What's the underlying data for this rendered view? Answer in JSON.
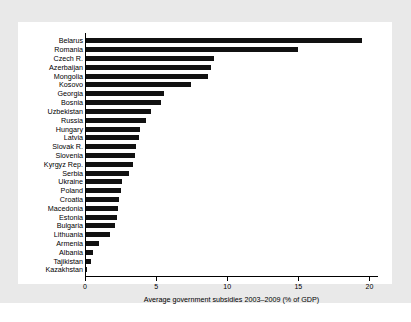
{
  "chart_data": {
    "type": "bar",
    "orientation": "horizontal",
    "title": "",
    "xlabel": "Average government subsidies 2003–2009 (% of GDP)",
    "ylabel": "",
    "xlim": [
      0,
      20.6
    ],
    "xticks": [
      0,
      5,
      10,
      15,
      20
    ],
    "xtick_labels": [
      "0",
      "5",
      "10",
      "15",
      "20"
    ],
    "grid": false,
    "legend": null,
    "bar_color": "#111111",
    "panel_background": "#ffffff",
    "figure_background": "#e9e9e9",
    "categories": [
      "Belarus",
      "Romania",
      "Czech R.",
      "Azerbaijan",
      "Mongolia",
      "Kosovo",
      "Georgia",
      "Bosnia",
      "Uzbekistan",
      "Russia",
      "Hungary",
      "Latvia",
      "Slovak R.",
      "Slovenia",
      "Kyrgyz Rep.",
      "Serbia",
      "Ukraine",
      "Poland",
      "Croatia",
      "Macedonia",
      "Estonia",
      "Bulgaria",
      "Lithuania",
      "Armenia",
      "Albania",
      "Tajikistan",
      "Kazakhstan"
    ],
    "values": [
      19.4,
      14.9,
      9.0,
      8.8,
      8.6,
      7.4,
      5.5,
      5.3,
      4.6,
      4.2,
      3.8,
      3.7,
      3.55,
      3.45,
      3.3,
      3.0,
      2.5,
      2.45,
      2.3,
      2.25,
      2.2,
      2.05,
      1.7,
      0.9,
      0.5,
      0.35,
      0.05
    ]
  }
}
